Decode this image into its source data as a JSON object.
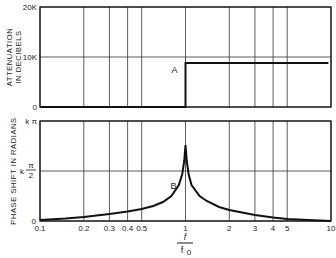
{
  "chart_data": [
    {
      "type": "line",
      "title": "",
      "xlabel_num": "f",
      "xlabel_den": "f0",
      "xlabel_den_main": "f",
      "xlabel_den_sub": "0",
      "ylabel_lines": [
        "ATTENUATION",
        "IN DECIBELS"
      ],
      "xscale": "log",
      "xlim": [
        0.1,
        10
      ],
      "ylim": [
        0,
        20000
      ],
      "xgrid": [
        0.1,
        0.2,
        0.3,
        0.4,
        0.5,
        1,
        2,
        3,
        4,
        5,
        10
      ],
      "yticks": [
        {
          "value": 0,
          "label": "0"
        },
        {
          "value": 10000,
          "label": "10K"
        },
        {
          "value": 20000,
          "label": "20K"
        }
      ],
      "grid": true,
      "series": [
        {
          "name": "A",
          "label": "A",
          "x": [
            0.1,
            1,
            1,
            9.6
          ],
          "y": [
            0,
            0,
            8800,
            8800
          ]
        }
      ]
    },
    {
      "type": "line",
      "title": "",
      "ylabel_lines": [
        "PHASE SHIFT IN RADIANS"
      ],
      "xscale": "log",
      "xlim": [
        0.1,
        10
      ],
      "ylim_fraction_of_kpi": [
        0,
        1
      ],
      "xgrid": [
        0.1,
        0.2,
        0.3,
        0.4,
        0.5,
        1,
        2,
        3,
        4,
        5,
        10
      ],
      "xticks": [
        {
          "value": 0.1,
          "label": "0.1"
        },
        {
          "value": 0.2,
          "label": "0.2"
        },
        {
          "value": 0.3,
          "label": "0.3"
        },
        {
          "value": 0.4,
          "label": "0.4"
        },
        {
          "value": 0.5,
          "label": "0.5"
        },
        {
          "value": 1,
          "label": "1"
        },
        {
          "value": 2,
          "label": "2"
        },
        {
          "value": 3,
          "label": "3"
        },
        {
          "value": 4,
          "label": "4"
        },
        {
          "value": 5,
          "label": "5"
        },
        {
          "value": 10,
          "label": "10"
        }
      ],
      "yticks": [
        {
          "value": 0,
          "label": "0"
        },
        {
          "value": 0.5,
          "label": "k π/2",
          "prefix": "k",
          "num": "π",
          "den": "2"
        },
        {
          "value": 1,
          "label": "k π"
        }
      ],
      "grid": true,
      "series": [
        {
          "name": "B",
          "label": "B",
          "units": "fraction of kπ",
          "x": [
            0.1,
            0.15,
            0.2,
            0.3,
            0.4,
            0.5,
            0.6,
            0.7,
            0.8,
            0.9,
            0.95,
            0.98,
            1.0,
            1.02,
            1.05,
            1.1,
            1.25,
            1.4,
            1.7,
            2,
            3,
            4,
            5,
            7,
            10
          ],
          "y": [
            0.01,
            0.025,
            0.04,
            0.07,
            0.095,
            0.12,
            0.15,
            0.19,
            0.25,
            0.36,
            0.47,
            0.6,
            0.76,
            0.6,
            0.47,
            0.36,
            0.25,
            0.2,
            0.14,
            0.11,
            0.06,
            0.035,
            0.02,
            0.01,
            0.0
          ]
        }
      ]
    }
  ]
}
